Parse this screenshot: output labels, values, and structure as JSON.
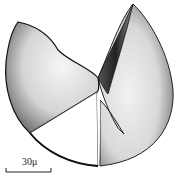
{
  "figure": {
    "scale_bar": {
      "label": "30μ"
    }
  }
}
